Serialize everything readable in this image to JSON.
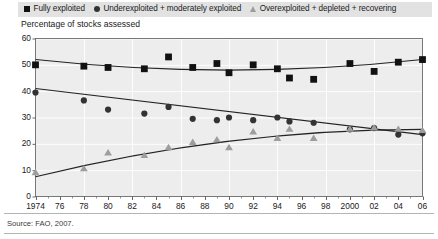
{
  "legend": {
    "entries": [
      {
        "marker": "square-marker-icon",
        "label": "Fully exploited",
        "color": "#111111"
      },
      {
        "marker": "circle-marker-icon",
        "label": "Underexploited + moderately exploited",
        "color": "#333333"
      },
      {
        "marker": "triangle-marker-icon",
        "label": "Overexploited + depleted + recovering",
        "color": "#9d9d9d"
      }
    ]
  },
  "source": {
    "text": "Source:  FAO, 2007."
  },
  "chart_data": {
    "type": "scatter",
    "title": "",
    "subtitle": "",
    "ylabel": "Percentage of stocks assessed",
    "xlabel": "",
    "ylim": [
      0,
      60
    ],
    "yticks": [
      0,
      10,
      20,
      30,
      40,
      50,
      60
    ],
    "xlim": [
      1974,
      2006
    ],
    "xticks": [
      1974,
      1976,
      1978,
      1980,
      1982,
      1984,
      1986,
      1988,
      1990,
      1992,
      1994,
      1996,
      1998,
      2000,
      2002,
      2004,
      2006
    ],
    "xtick_labels": [
      "1974",
      "76",
      "78",
      "80",
      "82",
      "84",
      "86",
      "88",
      "90",
      "92",
      "94",
      "96",
      "98",
      "2000",
      "02",
      "04",
      "06"
    ],
    "grid": true,
    "legend_position": "top",
    "series": [
      {
        "name": "Fully exploited",
        "marker": "square",
        "color": "#111111",
        "x": [
          1974,
          1978,
          1980,
          1983,
          1985,
          1987,
          1989,
          1990,
          1992,
          1994,
          1995,
          1997,
          2000,
          2002,
          2004,
          2006
        ],
        "values": [
          50.0,
          49.5,
          49.0,
          48.5,
          53.0,
          49.0,
          50.5,
          47.0,
          50.0,
          48.5,
          45.0,
          44.5,
          50.5,
          47.5,
          51.0,
          52.0
        ],
        "trend": {
          "x": [
            1974,
            1990,
            2006
          ],
          "values": [
            52.0,
            48.0,
            52.0
          ]
        }
      },
      {
        "name": "Underexploited + moderately exploited",
        "marker": "circle",
        "color": "#333333",
        "x": [
          1974,
          1978,
          1980,
          1983,
          1985,
          1987,
          1989,
          1990,
          1992,
          1994,
          1995,
          1997,
          2000,
          2002,
          2004,
          2006
        ],
        "values": [
          39.5,
          36.5,
          33.0,
          31.5,
          34.0,
          29.5,
          29.0,
          30.0,
          29.0,
          30.0,
          28.5,
          28.0,
          25.5,
          26.0,
          23.5,
          24.0
        ],
        "trend": {
          "x": [
            1974,
            2006
          ],
          "values": [
            41.0,
            23.5
          ]
        }
      },
      {
        "name": "Overexploited + depleted + recovering",
        "marker": "triangle",
        "color": "#9d9d9d",
        "x": [
          1974,
          1978,
          1980,
          1983,
          1985,
          1987,
          1989,
          1990,
          1992,
          1994,
          1995,
          1997,
          2000,
          2002,
          2004,
          2006
        ],
        "values": [
          9.0,
          10.5,
          16.5,
          15.5,
          18.5,
          20.5,
          21.5,
          18.5,
          24.5,
          22.0,
          25.5,
          22.0,
          25.5,
          26.0,
          25.5,
          25.0
        ],
        "trend": {
          "x": [
            1974,
            1990,
            2006
          ],
          "values": [
            7.5,
            21.0,
            25.5
          ]
        }
      }
    ]
  }
}
